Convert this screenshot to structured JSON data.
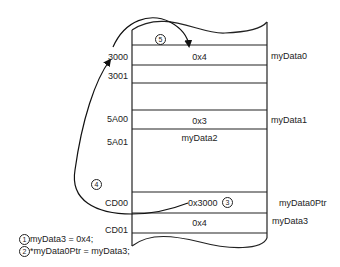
{
  "diagram": {
    "type": "memory-layout",
    "addresses": [
      {
        "label": "3000",
        "row": "row0"
      },
      {
        "label": "3001",
        "row": "row1"
      },
      {
        "label": "5A00",
        "row": "row3"
      },
      {
        "label": "5A01",
        "row": "row4"
      },
      {
        "label": "CD00",
        "row": "row6"
      },
      {
        "label": "CD01",
        "row": "row7"
      }
    ],
    "cells": [
      {
        "value": "0x4",
        "address": "3000"
      },
      {
        "value": "0x3",
        "address": "5A00"
      },
      {
        "value": "myData2",
        "address": "5A01"
      },
      {
        "value": "0x3000",
        "address": "CD00"
      },
      {
        "value": "0x4",
        "address": "CD01"
      }
    ],
    "variables": [
      {
        "name": "myData0",
        "address": "3000"
      },
      {
        "name": "myData1",
        "address": "5A00"
      },
      {
        "name": "myData0Ptr",
        "address": "CD00"
      },
      {
        "name": "myData3",
        "address": "CD01"
      }
    ],
    "steps": {
      "s1": "1",
      "s2": "2",
      "s3": "3",
      "s4": "4",
      "s5": "5"
    },
    "code": [
      {
        "num": "1",
        "text": "myData3 = 0x4;"
      },
      {
        "num": "2",
        "text": "*myData0Ptr = myData3;"
      }
    ]
  }
}
